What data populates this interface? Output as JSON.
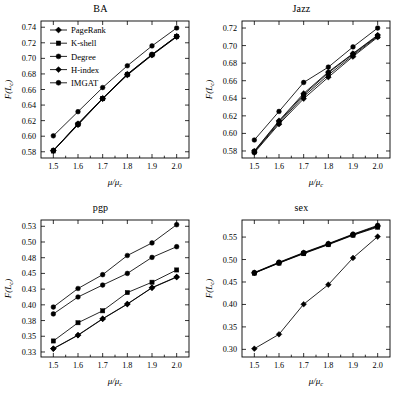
{
  "figure": {
    "panel_count": 4,
    "legend_panel": "BA"
  },
  "legend": {
    "entries": [
      {
        "label": "PageRank",
        "marker": "diamond"
      },
      {
        "label": "K-shell",
        "marker": "square"
      },
      {
        "label": "Degree",
        "marker": "circle"
      },
      {
        "label": "H-index",
        "marker": "diamond"
      },
      {
        "label": "IMGAT",
        "marker": "circle"
      }
    ]
  },
  "chart_data": [
    {
      "type": "line",
      "title": "BA",
      "xlabel": "μ/μc",
      "ylabel": "F(Lc)",
      "x": [
        1.5,
        1.6,
        1.7,
        1.8,
        1.9,
        2.0
      ],
      "xlim": [
        1.45,
        2.05
      ],
      "xticks": [
        "1.5",
        "1.6",
        "1.7",
        "1.8",
        "1.9",
        "2.0"
      ],
      "ylim": [
        0.572,
        0.748
      ],
      "yticks": [
        "0.58",
        "0.60",
        "0.62",
        "0.64",
        "0.66",
        "0.68",
        "0.70",
        "0.72",
        "0.74"
      ],
      "ytickvals": [
        0.58,
        0.6,
        0.62,
        0.64,
        0.66,
        0.68,
        0.7,
        0.72,
        0.74
      ],
      "grid": false,
      "legend_position": "upper-left",
      "series": [
        {
          "name": "PageRank",
          "values": [
            0.5815,
            0.6145,
            0.648,
            0.6785,
            0.704,
            0.7275
          ]
        },
        {
          "name": "K-shell",
          "values": [
            0.581,
            0.6152,
            0.6482,
            0.679,
            0.7045,
            0.728
          ]
        },
        {
          "name": "Degree",
          "values": [
            0.5818,
            0.6158,
            0.6485,
            0.6795,
            0.7048,
            0.7283
          ]
        },
        {
          "name": "H-index",
          "values": [
            0.5812,
            0.6162,
            0.6488,
            0.6798,
            0.705,
            0.7285
          ]
        },
        {
          "name": "IMGAT",
          "values": [
            0.6005,
            0.6315,
            0.6625,
            0.6905,
            0.716,
            0.739
          ]
        }
      ]
    },
    {
      "type": "line",
      "title": "Jazz",
      "xlabel": "μ/μc",
      "ylabel": "F(Lc)",
      "x": [
        1.5,
        1.6,
        1.7,
        1.8,
        1.9,
        2.0
      ],
      "xlim": [
        1.45,
        2.05
      ],
      "xticks": [
        "1.5",
        "1.6",
        "1.7",
        "1.8",
        "1.9",
        "2.0"
      ],
      "ylim": [
        0.572,
        0.728
      ],
      "yticks": [
        "0.58",
        "0.60",
        "0.62",
        "0.64",
        "0.66",
        "0.68",
        "0.70",
        "0.72"
      ],
      "ytickvals": [
        0.58,
        0.6,
        0.62,
        0.64,
        0.66,
        0.68,
        0.7,
        0.72
      ],
      "grid": false,
      "legend_position": "none",
      "series": [
        {
          "name": "PageRank",
          "values": [
            0.578,
            0.6105,
            0.6395,
            0.664,
            0.6875,
            0.7095
          ]
        },
        {
          "name": "K-shell",
          "values": [
            0.5788,
            0.612,
            0.642,
            0.6665,
            0.689,
            0.7105
          ]
        },
        {
          "name": "Degree",
          "values": [
            0.5795,
            0.6135,
            0.644,
            0.669,
            0.6905,
            0.7112
          ]
        },
        {
          "name": "H-index",
          "values": [
            0.58,
            0.6145,
            0.6455,
            0.67,
            0.691,
            0.712
          ]
        },
        {
          "name": "IMGAT",
          "values": [
            0.5925,
            0.625,
            0.658,
            0.6755,
            0.6985,
            0.72
          ]
        }
      ]
    },
    {
      "type": "line",
      "title": "pgp",
      "xlabel": "μ/μc",
      "ylabel": "F(Lc)",
      "x": [
        1.5,
        1.6,
        1.7,
        1.8,
        1.9,
        2.0
      ],
      "xlim": [
        1.45,
        2.05
      ],
      "xticks": [
        "1.5",
        "1.6",
        "1.7",
        "1.8",
        "1.9",
        "2.0"
      ],
      "ylim": [
        0.322,
        0.54
      ],
      "yticks": [
        "0.33",
        "0.35",
        "0.38",
        "0.40",
        "0.43",
        "0.45",
        "0.48",
        "0.50",
        "0.53"
      ],
      "ytickvals": [
        0.33,
        0.355,
        0.38,
        0.405,
        0.43,
        0.455,
        0.48,
        0.505,
        0.53
      ],
      "grid": false,
      "legend_position": "none",
      "series": [
        {
          "name": "PageRank",
          "values": [
            0.335,
            0.3565,
            0.3825,
            0.406,
            0.432,
            0.449
          ]
        },
        {
          "name": "K-shell",
          "values": [
            0.3475,
            0.3765,
            0.3955,
            0.4245,
            0.441,
            0.4605
          ]
        },
        {
          "name": "Degree",
          "values": [
            0.3905,
            0.4175,
            0.4365,
            0.455,
            0.4805,
            0.4975
          ]
        },
        {
          "name": "H-index",
          "values": [
            0.3355,
            0.357,
            0.383,
            0.4065,
            0.4325,
            0.4495
          ]
        },
        {
          "name": "IMGAT",
          "values": [
            0.4015,
            0.431,
            0.453,
            0.4835,
            0.5035,
            0.5325
          ]
        }
      ]
    },
    {
      "type": "line",
      "title": "sex",
      "xlabel": "μ/μc",
      "ylabel": "F(Lc)",
      "x": [
        1.5,
        1.6,
        1.7,
        1.8,
        1.9,
        2.0
      ],
      "xlim": [
        1.45,
        2.05
      ],
      "xticks": [
        "1.5",
        "1.6",
        "1.7",
        "1.8",
        "1.9",
        "2.0"
      ],
      "ylim": [
        0.283,
        0.588
      ],
      "yticks": [
        "0.30",
        "0.35",
        "0.40",
        "0.45",
        "0.50",
        "0.55"
      ],
      "ytickvals": [
        0.3,
        0.35,
        0.4,
        0.45,
        0.5,
        0.55
      ],
      "grid": false,
      "legend_position": "none",
      "series": [
        {
          "name": "PageRank",
          "values": [
            0.3015,
            0.3335,
            0.4005,
            0.444,
            0.5035,
            0.551
          ]
        },
        {
          "name": "K-shell",
          "values": [
            0.4695,
            0.492,
            0.513,
            0.533,
            0.554,
            0.572
          ]
        },
        {
          "name": "Degree",
          "values": [
            0.47,
            0.4925,
            0.514,
            0.534,
            0.555,
            0.5735
          ]
        },
        {
          "name": "H-index",
          "values": [
            0.4705,
            0.493,
            0.5145,
            0.5345,
            0.5555,
            0.5745
          ]
        },
        {
          "name": "IMGAT",
          "values": [
            0.471,
            0.494,
            0.5155,
            0.5355,
            0.5565,
            0.576
          ]
        }
      ]
    }
  ]
}
